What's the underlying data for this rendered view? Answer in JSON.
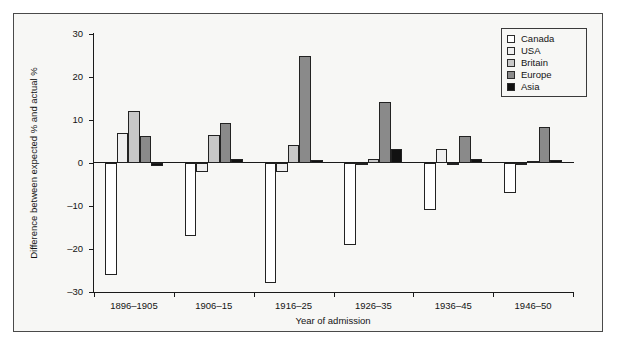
{
  "figure": {
    "background": "#f7f7f5",
    "frame_color": "#4a4a4a"
  },
  "axis": {
    "ylabel": "Difference between expected % and actual %",
    "xlabel": "Year of admission",
    "yticks": [
      30,
      20,
      10,
      0,
      -10,
      -20,
      -30
    ],
    "ytick_labels": [
      "30",
      "20",
      "10",
      "0",
      "–10",
      "–20",
      "–30"
    ]
  },
  "legend": {
    "position": "top-right",
    "entries": [
      {
        "label": "Canada",
        "color": "#ffffff"
      },
      {
        "label": "USA",
        "color": "#efefef"
      },
      {
        "label": "Britain",
        "color": "#c8c8c8"
      },
      {
        "label": "Europe",
        "color": "#8a8a8a"
      },
      {
        "label": "Asia",
        "color": "#111111"
      }
    ]
  },
  "chart_data": {
    "type": "bar",
    "title": "",
    "xlabel": "Year of admission",
    "ylabel": "Difference between expected % and actual %",
    "ylim": [
      -30,
      30
    ],
    "grid": false,
    "legend_position": "top-right",
    "categories": [
      "1896–1905",
      "1906–15",
      "1916–25",
      "1926–35",
      "1936–45",
      "1946–50"
    ],
    "series": [
      {
        "name": "Canada",
        "color": "#ffffff",
        "values": [
          -26.0,
          -17.0,
          -28.0,
          -19.0,
          -11.0,
          -7.0
        ]
      },
      {
        "name": "USA",
        "color": "#efefef",
        "values": [
          7.0,
          -2.0,
          -2.0,
          -0.5,
          3.3,
          -0.5
        ]
      },
      {
        "name": "Britain",
        "color": "#c8c8c8",
        "values": [
          12.0,
          6.5,
          4.3,
          1.0,
          -0.5,
          0.5
        ]
      },
      {
        "name": "Europe",
        "color": "#8a8a8a",
        "values": [
          6.2,
          9.3,
          25.0,
          14.2,
          6.3,
          8.3
        ]
      },
      {
        "name": "Asia",
        "color": "#111111",
        "values": [
          -0.6,
          1.0,
          0.7,
          3.3,
          1.0,
          0.7
        ]
      }
    ]
  }
}
